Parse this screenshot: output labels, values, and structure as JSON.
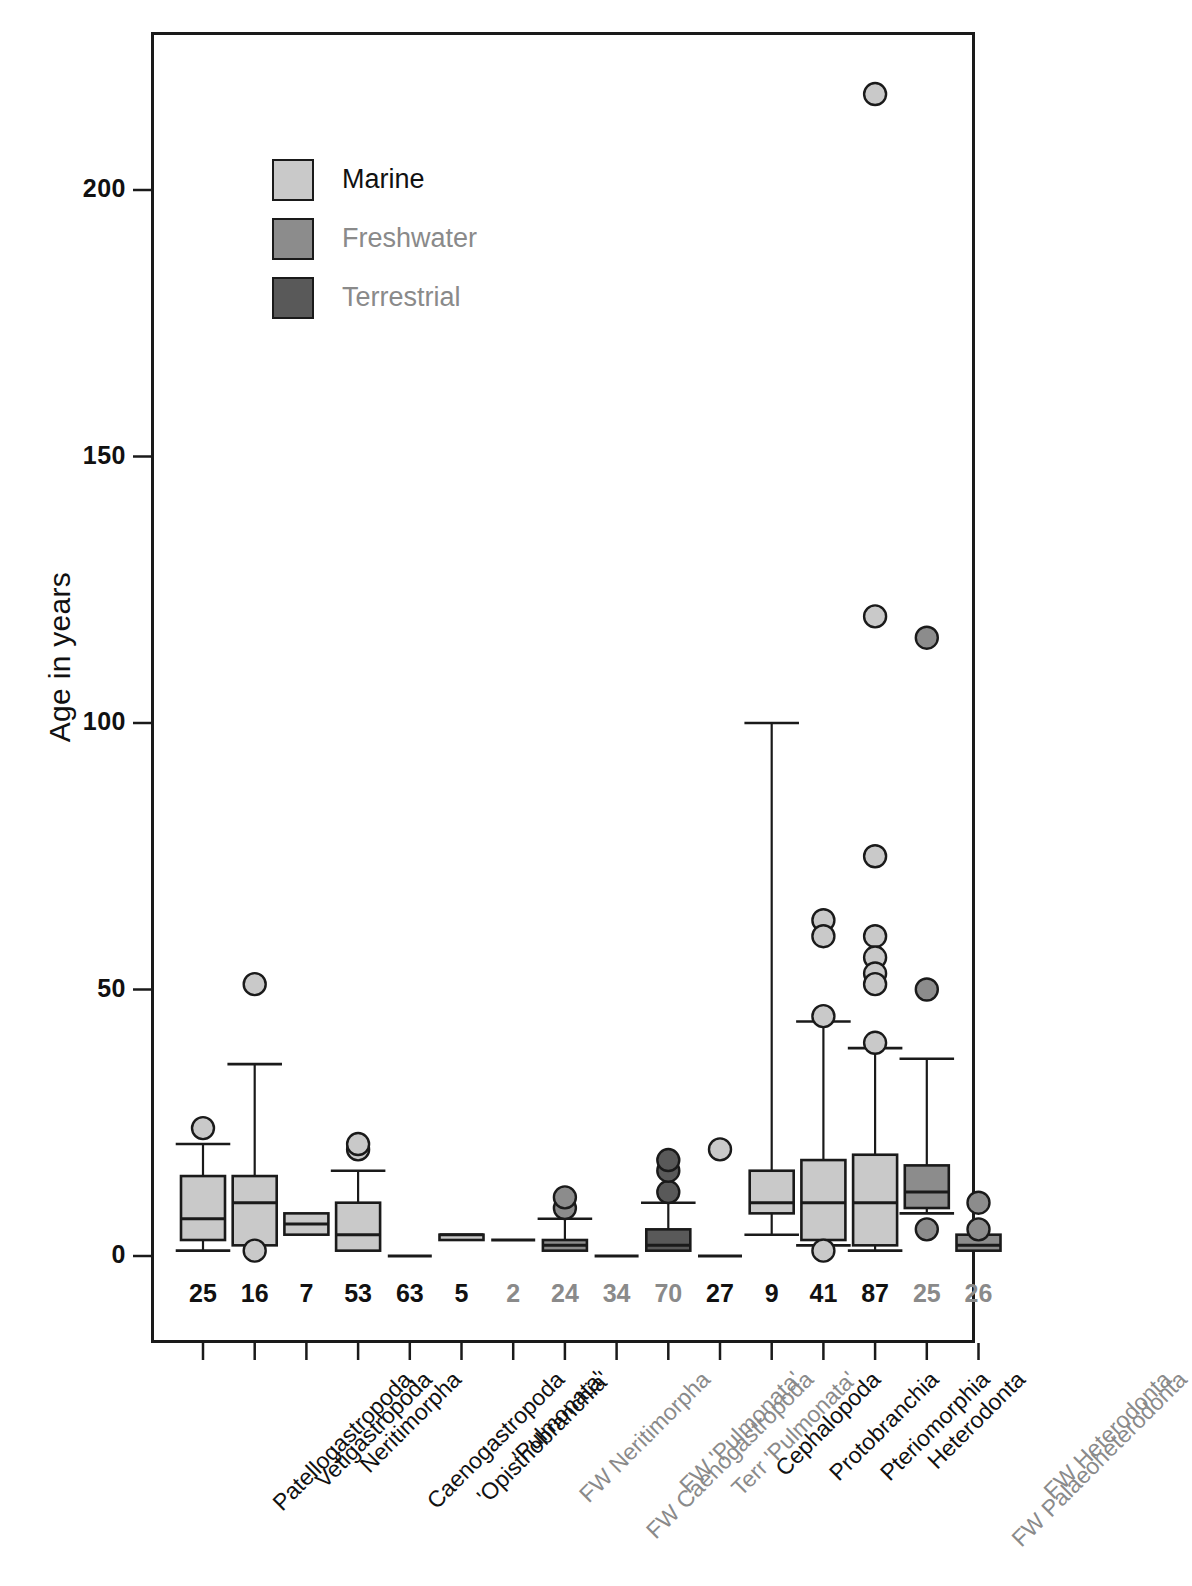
{
  "figure": {
    "y_axis_title": "Age in years",
    "marine_color": "#c9c9c9",
    "freshwater_color": "#8c8c8c",
    "terrestrial_color": "#595959",
    "marine_text_color": "#111111",
    "freshwater_text_color": "#8a8a8a",
    "terrestrial_text_color": "#8a8a8a",
    "outline_color": "#1a1a1a"
  },
  "legend": {
    "items": [
      {
        "label": "Marine",
        "swatch": "#c9c9c9",
        "text_color": "#111111"
      },
      {
        "label": "Freshwater",
        "swatch": "#8c8c8c",
        "text_color": "#8a8a8a"
      },
      {
        "label": "Terrestrial",
        "swatch": "#595959",
        "text_color": "#8a8a8a"
      }
    ]
  },
  "chart_data": {
    "type": "box",
    "title": "",
    "xlabel": "",
    "ylabel": "Age in years",
    "ylim": [
      -10,
      225
    ],
    "yticks": [
      0,
      50,
      100,
      150,
      200
    ],
    "ytick_labels": [
      "0",
      "50",
      "100",
      "150",
      "200"
    ],
    "grid": false,
    "legend_position": "upper-left-inset",
    "group_colors": {
      "Marine": "#c9c9c9",
      "Freshwater": "#8c8c8c",
      "Terrestrial": "#595959"
    },
    "categories": [
      "Patellogastropoda",
      "Vetigastropoda",
      "Neritimorpha",
      "Caenogastropoda",
      "'Opisthobranchia'",
      "'Pulmonata'",
      "FW Neritimorpha",
      "FW Caenogastropoda",
      "FW 'Pulmonata'",
      "Terr 'Pulmonata'",
      "Cephalopoda",
      "Protobranchia",
      "Pteriomorphia",
      "Heterodonta",
      "FW Palaeoheterodonta",
      "FW Heterodonta"
    ],
    "sample_sizes": [
      25,
      16,
      7,
      53,
      63,
      5,
      2,
      24,
      34,
      70,
      27,
      9,
      41,
      87,
      25,
      26
    ],
    "boxes": [
      {
        "category": "Patellogastropoda",
        "habitat": "Marine",
        "whisker_low": 1,
        "q1": 3,
        "median": 7,
        "q3": 15,
        "whisker_high": 21,
        "outliers": [
          24
        ]
      },
      {
        "category": "Vetigastropoda",
        "habitat": "Marine",
        "whisker_low": 2,
        "q1": 2,
        "median": 10,
        "q3": 15,
        "whisker_high": 36,
        "outliers": [
          51,
          1
        ]
      },
      {
        "category": "Neritimorpha",
        "habitat": "Marine",
        "whisker_low": 4,
        "q1": 4,
        "median": 6,
        "q3": 8,
        "whisker_high": 8,
        "outliers": []
      },
      {
        "category": "Caenogastropoda",
        "habitat": "Marine",
        "whisker_low": 1,
        "q1": 1,
        "median": 4,
        "q3": 10,
        "whisker_high": 16,
        "outliers": [
          20,
          21
        ]
      },
      {
        "category": "'Opisthobranchia'",
        "habitat": "Marine",
        "whisker_low": 0,
        "q1": 0,
        "median": 0,
        "q3": 0,
        "whisker_high": 0,
        "outliers": []
      },
      {
        "category": "'Pulmonata'",
        "habitat": "Marine",
        "whisker_low": 3,
        "q1": 3,
        "median": 4,
        "q3": 4,
        "whisker_high": 4,
        "outliers": []
      },
      {
        "category": "FW Neritimorpha",
        "habitat": "Freshwater",
        "whisker_low": 3,
        "q1": 3,
        "median": 3,
        "q3": 3,
        "whisker_high": 3,
        "outliers": []
      },
      {
        "category": "FW Caenogastropoda",
        "habitat": "Freshwater",
        "whisker_low": 1,
        "q1": 1,
        "median": 2,
        "q3": 3,
        "whisker_high": 7,
        "outliers": [
          9,
          11
        ]
      },
      {
        "category": "FW 'Pulmonata'",
        "habitat": "Freshwater",
        "whisker_low": 0,
        "q1": 0,
        "median": 0,
        "q3": 0,
        "whisker_high": 0,
        "outliers": []
      },
      {
        "category": "Terr 'Pulmonata'",
        "habitat": "Terrestrial",
        "whisker_low": 1,
        "q1": 1,
        "median": 2,
        "q3": 5,
        "whisker_high": 10,
        "outliers": [
          12,
          16,
          18
        ]
      },
      {
        "category": "Cephalopoda",
        "habitat": "Marine",
        "whisker_low": 0,
        "q1": 0,
        "median": 0,
        "q3": 0,
        "whisker_high": 0,
        "outliers": [
          20
        ]
      },
      {
        "category": "Protobranchia",
        "habitat": "Marine",
        "whisker_low": 4,
        "q1": 8,
        "median": 10,
        "q3": 16,
        "whisker_high": 100,
        "outliers": []
      },
      {
        "category": "Pteriomorphia",
        "habitat": "Marine",
        "whisker_low": 2,
        "q1": 3,
        "median": 10,
        "q3": 18,
        "whisker_high": 44,
        "outliers": [
          63,
          60,
          45,
          1
        ]
      },
      {
        "category": "Heterodonta",
        "habitat": "Marine",
        "whisker_low": 1,
        "q1": 2,
        "median": 10,
        "q3": 19,
        "whisker_high": 39,
        "outliers": [
          218,
          120,
          75,
          60,
          56,
          53,
          51,
          40
        ]
      },
      {
        "category": "FW Palaeoheterodonta",
        "habitat": "Freshwater",
        "whisker_low": 8,
        "q1": 9,
        "median": 12,
        "q3": 17,
        "whisker_high": 37,
        "outliers": [
          116,
          50,
          5
        ]
      },
      {
        "category": "FW Heterodonta",
        "habitat": "Freshwater",
        "whisker_low": 1,
        "q1": 1,
        "median": 2,
        "q3": 4,
        "whisker_high": 4,
        "outliers": [
          10,
          5
        ]
      }
    ]
  }
}
